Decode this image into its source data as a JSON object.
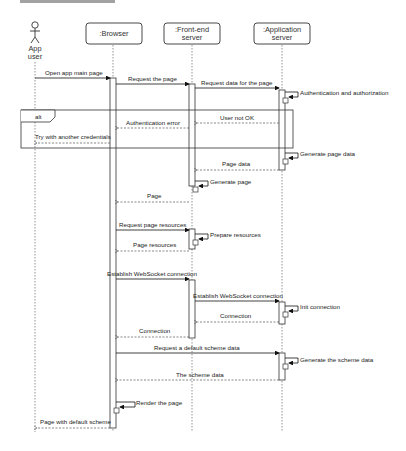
{
  "diagram": {
    "type": "sequence",
    "top_cutoff_text": "",
    "participants": [
      {
        "id": "user",
        "kind": "actor",
        "label_line1": "App",
        "label_line2": "user"
      },
      {
        "id": "browser",
        "kind": "object",
        "label_line1": ":Browser",
        "label_line2": ""
      },
      {
        "id": "frontend",
        "kind": "object",
        "label_line1": ":Front-end",
        "label_line2": "server"
      },
      {
        "id": "appserver",
        "kind": "object",
        "label_line1": ":Application",
        "label_line2": "server"
      }
    ],
    "fragment": {
      "operator": "alt"
    },
    "messages": [
      {
        "from": "user",
        "to": "browser",
        "kind": "sync",
        "label": "Open app main page"
      },
      {
        "from": "browser",
        "to": "frontend",
        "kind": "sync",
        "label": "Request the page"
      },
      {
        "from": "frontend",
        "to": "appserver",
        "kind": "sync",
        "label": "Request data for the page"
      },
      {
        "from": "appserver",
        "to": "appserver",
        "kind": "self",
        "label": "Authentication and authorization"
      },
      {
        "from": "appserver",
        "to": "frontend",
        "kind": "return",
        "label": "User not OK"
      },
      {
        "from": "frontend",
        "to": "browser",
        "kind": "return",
        "label": "Authentication error"
      },
      {
        "from": "browser",
        "to": "user",
        "kind": "return",
        "label": "Try with another credentials"
      },
      {
        "from": "appserver",
        "to": "appserver",
        "kind": "self",
        "label": "Generate page data"
      },
      {
        "from": "appserver",
        "to": "frontend",
        "kind": "return",
        "label": "Page data"
      },
      {
        "from": "frontend",
        "to": "frontend",
        "kind": "self",
        "label": "Generate page"
      },
      {
        "from": "frontend",
        "to": "browser",
        "kind": "return",
        "label": "Page"
      },
      {
        "from": "browser",
        "to": "frontend",
        "kind": "sync",
        "label": "Request page resources"
      },
      {
        "from": "frontend",
        "to": "frontend",
        "kind": "self",
        "label": "Prepare resources"
      },
      {
        "from": "frontend",
        "to": "browser",
        "kind": "return",
        "label": "Page resources"
      },
      {
        "from": "browser",
        "to": "frontend",
        "kind": "sync",
        "label": "Establish WebSocket connection"
      },
      {
        "from": "frontend",
        "to": "appserver",
        "kind": "sync",
        "label": "Establish WebSocket connection"
      },
      {
        "from": "appserver",
        "to": "appserver",
        "kind": "self",
        "label": "Init connection"
      },
      {
        "from": "appserver",
        "to": "frontend",
        "kind": "return",
        "label": "Connection"
      },
      {
        "from": "frontend",
        "to": "browser",
        "kind": "return",
        "label": "Connection"
      },
      {
        "from": "browser",
        "to": "appserver",
        "kind": "sync",
        "label": "Request a default scheme data"
      },
      {
        "from": "appserver",
        "to": "appserver",
        "kind": "self",
        "label": "Generate the scheme data"
      },
      {
        "from": "appserver",
        "to": "browser",
        "kind": "return",
        "label": "The scheme data"
      },
      {
        "from": "browser",
        "to": "browser",
        "kind": "self",
        "label": "Render the page"
      },
      {
        "from": "browser",
        "to": "user",
        "kind": "return",
        "label": "Page with default scheme"
      }
    ]
  }
}
